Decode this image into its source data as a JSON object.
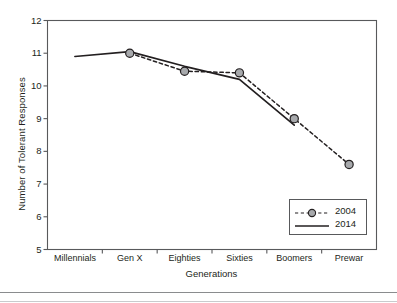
{
  "chart_data": {
    "type": "line",
    "title": "",
    "xlabel": "Generations",
    "ylabel": "Number of Tolerant Responses",
    "categories": [
      "Millennials",
      "Gen X",
      "Eighties",
      "Sixties",
      "Boomers",
      "Prewar"
    ],
    "ylim": [
      5,
      12
    ],
    "yticks": [
      5,
      6,
      7,
      8,
      9,
      10,
      11,
      12
    ],
    "ytick_labels": [
      "5",
      "6",
      "7",
      "8",
      "9",
      "10",
      "11",
      "12"
    ],
    "grid": false,
    "legend_position": "lower right",
    "series": [
      {
        "name": "2004",
        "style": "dashed",
        "marker": "circle",
        "color": "#231f20",
        "marker_fill": "#a7a9ac",
        "values": [
          null,
          11.0,
          10.45,
          10.4,
          9.0,
          7.6
        ]
      },
      {
        "name": "2014",
        "style": "solid",
        "marker": "none",
        "color": "#231f20",
        "values": [
          10.9,
          11.05,
          10.6,
          10.2,
          8.8,
          null
        ]
      }
    ]
  },
  "legend": {
    "entries": [
      {
        "label": "2004"
      },
      {
        "label": "2014"
      }
    ]
  },
  "axes": {
    "frame_color": "#58595b"
  }
}
